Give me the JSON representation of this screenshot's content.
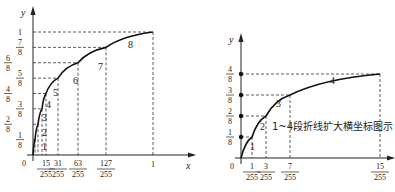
{
  "chart_data": [
    {
      "type": "line",
      "title": "",
      "xlabel": "x",
      "ylabel": "y",
      "xlim": [
        0,
        1
      ],
      "ylim": [
        0,
        1
      ],
      "grid": false,
      "origin_label": "0",
      "x_ticks": [
        {
          "num": "15",
          "den": "255",
          "value": 0.0588
        },
        {
          "num": "31",
          "den": "255",
          "value": 0.1216
        },
        {
          "num": "63",
          "den": "255",
          "value": 0.2471
        },
        {
          "num": "127",
          "den": "255",
          "value": 0.498
        },
        {
          "num": "1",
          "den": "",
          "value": 1
        }
      ],
      "y_ticks": [
        {
          "num": "1",
          "den": "8",
          "value": 0.125
        },
        {
          "num": "2",
          "den": "8",
          "value": 0.25
        },
        {
          "num": "3",
          "den": "8",
          "value": 0.375
        },
        {
          "num": "4",
          "den": "8",
          "value": 0.5
        },
        {
          "num": "5",
          "den": "8",
          "value": 0.625
        },
        {
          "num": "6",
          "den": "8",
          "value": 0.75
        },
        {
          "num": "7",
          "den": "8",
          "value": 0.875
        },
        {
          "num": "1",
          "den": "",
          "value": 1
        }
      ],
      "series": [
        {
          "name": "piecewise-compression-curve",
          "points": [
            [
              0,
              0
            ],
            [
              0.0039,
              0.125
            ],
            [
              0.0118,
              0.25
            ],
            [
              0.0275,
              0.375
            ],
            [
              0.0588,
              0.5
            ],
            [
              0.1216,
              0.625
            ],
            [
              0.2471,
              0.75
            ],
            [
              0.498,
              0.875
            ],
            [
              1,
              1
            ]
          ]
        }
      ],
      "segment_labels": [
        "1",
        "2",
        "3",
        "4",
        "5",
        "6",
        "7",
        "8"
      ]
    },
    {
      "type": "line",
      "title": "",
      "xlabel": "",
      "ylabel": "y",
      "xlim": [
        0,
        0.0588
      ],
      "ylim": [
        0,
        0.5
      ],
      "grid": false,
      "origin_label": "0",
      "x_ticks": [
        {
          "num": "1",
          "den": "255",
          "value": 0.0039
        },
        {
          "num": "3",
          "den": "255",
          "value": 0.0118
        },
        {
          "num": "7",
          "den": "255",
          "value": 0.0275
        },
        {
          "num": "15",
          "den": "255",
          "value": 0.0588
        }
      ],
      "y_ticks": [
        {
          "num": "1",
          "den": "8",
          "value": 0.125
        },
        {
          "num": "2",
          "den": "8",
          "value": 0.25
        },
        {
          "num": "3",
          "den": "8",
          "value": 0.375
        },
        {
          "num": "4",
          "den": "8",
          "value": 0.5
        }
      ],
      "series": [
        {
          "name": "segments-1-4-expanded",
          "points": [
            [
              0,
              0
            ],
            [
              0.0039,
              0.125
            ],
            [
              0.0118,
              0.25
            ],
            [
              0.0275,
              0.375
            ],
            [
              0.0588,
              0.5
            ]
          ]
        }
      ],
      "segment_labels": [
        "1",
        "2",
        "3",
        "4"
      ],
      "annotation": "1~4段折线扩大横坐标图示"
    }
  ]
}
